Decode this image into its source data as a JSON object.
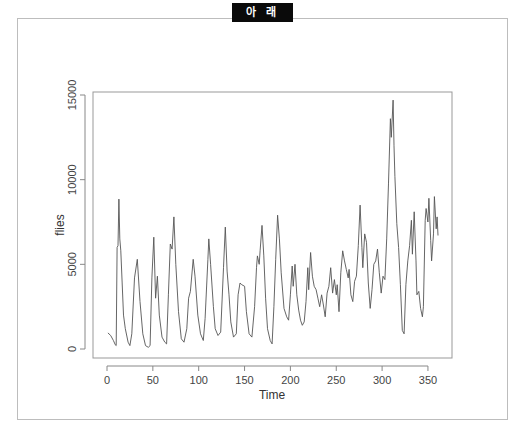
{
  "header": {
    "badge_label": "아 래"
  },
  "chart_data": {
    "type": "line",
    "title": "",
    "xlabel": "Time",
    "ylabel": "flies",
    "xlim": [
      0,
      361
    ],
    "ylim": [
      0,
      15000
    ],
    "x_ticks": [
      0,
      50,
      100,
      150,
      200,
      250,
      300,
      350
    ],
    "y_ticks": [
      0,
      5000,
      10000,
      15000
    ],
    "grid": false,
    "legend": null,
    "line_color": "#555555",
    "keypoints": [
      [
        1,
        950
      ],
      [
        4,
        800
      ],
      [
        7,
        500
      ],
      [
        9,
        250
      ],
      [
        10,
        200
      ],
      [
        11,
        6000
      ],
      [
        12,
        6100
      ],
      [
        13,
        8850
      ],
      [
        14,
        6500
      ],
      [
        15,
        5800
      ],
      [
        18,
        2000
      ],
      [
        20,
        1200
      ],
      [
        23,
        400
      ],
      [
        25,
        200
      ],
      [
        27,
        900
      ],
      [
        30,
        4200
      ],
      [
        33,
        5300
      ],
      [
        36,
        2800
      ],
      [
        39,
        900
      ],
      [
        42,
        200
      ],
      [
        45,
        100
      ],
      [
        47,
        200
      ],
      [
        49,
        4200
      ],
      [
        51,
        6600
      ],
      [
        53,
        3000
      ],
      [
        55,
        4300
      ],
      [
        57,
        2000
      ],
      [
        60,
        700
      ],
      [
        63,
        400
      ],
      [
        65,
        300
      ],
      [
        67,
        3200
      ],
      [
        69,
        6200
      ],
      [
        71,
        5900
      ],
      [
        73,
        7800
      ],
      [
        75,
        5000
      ],
      [
        78,
        2200
      ],
      [
        81,
        600
      ],
      [
        84,
        400
      ],
      [
        87,
        1200
      ],
      [
        89,
        3000
      ],
      [
        91,
        3400
      ],
      [
        94,
        5300
      ],
      [
        96,
        4300
      ],
      [
        99,
        2000
      ],
      [
        102,
        900
      ],
      [
        105,
        500
      ],
      [
        107,
        1800
      ],
      [
        110,
        5300
      ],
      [
        111,
        6500
      ],
      [
        113,
        5000
      ],
      [
        116,
        2500
      ],
      [
        118,
        1200
      ],
      [
        121,
        800
      ],
      [
        124,
        1000
      ],
      [
        127,
        4800
      ],
      [
        129,
        7200
      ],
      [
        131,
        4600
      ],
      [
        133,
        3200
      ],
      [
        135,
        1600
      ],
      [
        138,
        700
      ],
      [
        141,
        900
      ],
      [
        143,
        3200
      ],
      [
        145,
        3900
      ],
      [
        147,
        3800
      ],
      [
        150,
        3700
      ],
      [
        152,
        2200
      ],
      [
        155,
        900
      ],
      [
        158,
        700
      ],
      [
        161,
        2500
      ],
      [
        163,
        4800
      ],
      [
        164,
        5500
      ],
      [
        166,
        5000
      ],
      [
        167,
        5800
      ],
      [
        169,
        7300
      ],
      [
        171,
        5500
      ],
      [
        173,
        3000
      ],
      [
        175,
        1200
      ],
      [
        178,
        500
      ],
      [
        180,
        300
      ],
      [
        182,
        2500
      ],
      [
        184,
        5300
      ],
      [
        186,
        7900
      ],
      [
        188,
        6500
      ],
      [
        190,
        4500
      ],
      [
        193,
        2400
      ],
      [
        196,
        1900
      ],
      [
        198,
        1700
      ],
      [
        200,
        3200
      ],
      [
        202,
        4900
      ],
      [
        203,
        3700
      ],
      [
        205,
        5000
      ],
      [
        207,
        3200
      ],
      [
        209,
        2300
      ],
      [
        211,
        1700
      ],
      [
        213,
        1400
      ],
      [
        215,
        1600
      ],
      [
        217,
        2800
      ],
      [
        219,
        4800
      ],
      [
        220,
        3500
      ],
      [
        222,
        5700
      ],
      [
        224,
        4300
      ],
      [
        226,
        3700
      ],
      [
        228,
        3500
      ],
      [
        230,
        3000
      ],
      [
        232,
        2500
      ],
      [
        234,
        3200
      ],
      [
        236,
        2600
      ],
      [
        238,
        1900
      ],
      [
        240,
        3300
      ],
      [
        242,
        3700
      ],
      [
        244,
        4800
      ],
      [
        246,
        3300
      ],
      [
        248,
        4100
      ],
      [
        250,
        3200
      ],
      [
        251,
        3800
      ],
      [
        253,
        2200
      ],
      [
        255,
        4500
      ],
      [
        257,
        5800
      ],
      [
        259,
        5200
      ],
      [
        261,
        4700
      ],
      [
        263,
        4200
      ],
      [
        264,
        4700
      ],
      [
        266,
        3200
      ],
      [
        268,
        2800
      ],
      [
        270,
        4000
      ],
      [
        272,
        4300
      ],
      [
        274,
        6100
      ],
      [
        276,
        8500
      ],
      [
        278,
        6000
      ],
      [
        279,
        4800
      ],
      [
        281,
        6800
      ],
      [
        283,
        6300
      ],
      [
        285,
        3900
      ],
      [
        287,
        2400
      ],
      [
        289,
        3500
      ],
      [
        291,
        5000
      ],
      [
        293,
        5200
      ],
      [
        295,
        5900
      ],
      [
        297,
        4500
      ],
      [
        299,
        3300
      ],
      [
        301,
        4300
      ],
      [
        303,
        4100
      ],
      [
        305,
        6500
      ],
      [
        307,
        9800
      ],
      [
        309,
        13600
      ],
      [
        310,
        12500
      ],
      [
        312,
        14700
      ],
      [
        313,
        12000
      ],
      [
        314,
        10200
      ],
      [
        316,
        7400
      ],
      [
        318,
        6000
      ],
      [
        320,
        3800
      ],
      [
        322,
        1100
      ],
      [
        324,
        900
      ],
      [
        326,
        3800
      ],
      [
        328,
        5200
      ],
      [
        330,
        6100
      ],
      [
        332,
        7600
      ],
      [
        333,
        5600
      ],
      [
        335,
        8100
      ],
      [
        337,
        5200
      ],
      [
        338,
        3200
      ],
      [
        340,
        3400
      ],
      [
        342,
        2400
      ],
      [
        344,
        1900
      ],
      [
        345,
        2500
      ],
      [
        347,
        7600
      ],
      [
        348,
        8300
      ],
      [
        350,
        7500
      ],
      [
        351,
        8900
      ],
      [
        353,
        6400
      ],
      [
        354,
        5200
      ],
      [
        356,
        6800
      ],
      [
        357,
        9000
      ],
      [
        359,
        7100
      ],
      [
        360,
        7800
      ],
      [
        361,
        6700
      ]
    ]
  }
}
